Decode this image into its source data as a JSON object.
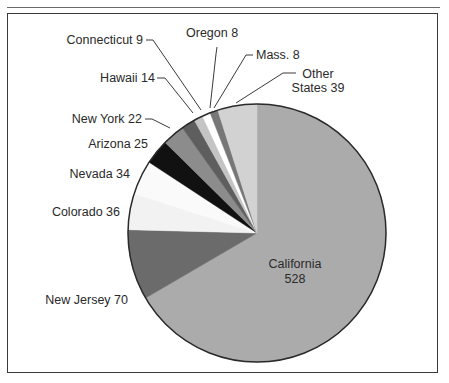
{
  "chart_data": {
    "type": "pie",
    "title": "",
    "start_angle_deg": 0,
    "direction": "clockwise",
    "center": [
      257,
      233
    ],
    "radius": 129,
    "total": 793,
    "slices": [
      {
        "label": "California",
        "value": 528,
        "display": "California 528",
        "color": "#ababab"
      },
      {
        "label": "New Jersey",
        "value": 70,
        "display": "New Jersey 70",
        "color": "#6b6b6b"
      },
      {
        "label": "Colorado",
        "value": 36,
        "display": "Colorado 36",
        "color": "#f2f2f2"
      },
      {
        "label": "Nevada",
        "value": 34,
        "display": "Nevada 34",
        "color": "#fafafa"
      },
      {
        "label": "Arizona",
        "value": 25,
        "display": "Arizona 25",
        "color": "#111111"
      },
      {
        "label": "New York",
        "value": 22,
        "display": "New York 22",
        "color": "#8c8c8c"
      },
      {
        "label": "Hawaii",
        "value": 14,
        "display": "Hawaii 14",
        "color": "#5e5e5e"
      },
      {
        "label": "Connecticut",
        "value": 9,
        "display": "Connecticut 9",
        "color": "#c4c4c4"
      },
      {
        "label": "Oregon",
        "value": 8,
        "display": "Oregon 8",
        "color": "#ffffff"
      },
      {
        "label": "Mass.",
        "value": 8,
        "display": "Mass. 8",
        "color": "#777777"
      },
      {
        "label": "Other States",
        "value": 39,
        "display": "Other States 39",
        "color": "#d2d2d2"
      }
    ],
    "legend": "none (direct labels with leader lines)",
    "grid": false
  },
  "labels": {
    "california_name": "California",
    "california_value": "528",
    "new_jersey": "New Jersey 70",
    "colorado": "Colorado 36",
    "nevada": "Nevada 34",
    "arizona": "Arizona 25",
    "new_york": "New York 22",
    "hawaii": "Hawaii 14",
    "connecticut": "Connecticut 9",
    "oregon": "Oregon 8",
    "mass": "Mass. 8",
    "other_line1": "Other",
    "other_line2": "States 39"
  },
  "leaders": [
    {
      "name": "leader-new-york",
      "points": "145,119 152,119 170,128"
    },
    {
      "name": "leader-hawaii",
      "points": "157,78 165,78 193,113"
    },
    {
      "name": "leader-connecticut",
      "points": "146,40 153,40 201,110"
    },
    {
      "name": "leader-oregon",
      "points": "217,47 216,54 210,108"
    },
    {
      "name": "leader-mass",
      "points": "253,55 246,55 214,108"
    },
    {
      "name": "leader-other-states",
      "points": "296,73 283,73 236,103"
    }
  ]
}
